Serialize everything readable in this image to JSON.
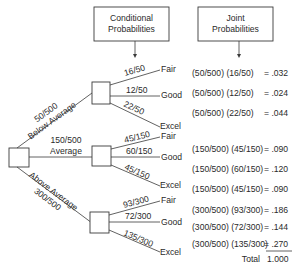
{
  "headers": {
    "conditional": [
      "Conditional",
      "Probabilities"
    ],
    "joint": [
      "Joint",
      "Probabilities"
    ]
  },
  "branches": [
    {
      "prob": "50/500",
      "label": "Below Average",
      "outcomes": [
        {
          "prob": "16/50",
          "label": "Fair",
          "expr": "(50/500) (16/50)",
          "result": "= .032"
        },
        {
          "prob": "12/50",
          "label": "Good",
          "expr": "(50/500) (12/50)",
          "result": "= .024"
        },
        {
          "prob": "22/50",
          "label": "Excel",
          "expr": "(50/500) (22/50)",
          "result": "= .044"
        }
      ]
    },
    {
      "prob": "150/500",
      "label": "Average",
      "outcomes": [
        {
          "prob": "45/150",
          "label": "Fair",
          "expr": "(150/500) (45/150)",
          "result": "= .090"
        },
        {
          "prob": "60/150",
          "label": "Good",
          "expr": "(150/500) (60/150)",
          "result": "= .120"
        },
        {
          "prob": "45/150",
          "label": "Excel",
          "expr": "(150/500) (45/150)",
          "result": "= .090"
        }
      ]
    },
    {
      "prob": "300/500",
      "label": "Above Average",
      "outcomes": [
        {
          "prob": "93/300",
          "label": "Fair",
          "expr": "(300/500) (93/300)",
          "result": "= .186"
        },
        {
          "prob": "72/300",
          "label": "Good",
          "expr": "(300/500) (72/300)",
          "result": "= .144"
        },
        {
          "prob": "135/300",
          "label": "Excel",
          "expr": "(300/500) (135/300)",
          "result": "= .270"
        }
      ]
    }
  ],
  "total": {
    "label": "Total",
    "value": "1.000"
  }
}
